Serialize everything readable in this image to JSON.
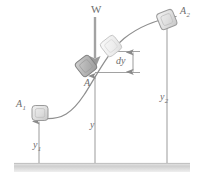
{
  "figure": {
    "type": "mechanics-free-body-diagram",
    "background_color": "#ffffff",
    "line_color": "#8a8a8a",
    "label_color": "#6d6d6d",
    "block_fill": "#d8d8d8",
    "block_fill_light": "#ececec",
    "block_stroke": "#9a9a9a",
    "ground_color": "#d0d0d0",
    "labels": {
      "weight": "W",
      "point_a": "A",
      "position_start": "A",
      "position_start_sub": "1",
      "position_end": "A",
      "position_end_sub": "2",
      "height_start": "y",
      "height_start_sub": "1",
      "height_mid": "y",
      "height_end": "y",
      "height_end_sub": "2",
      "differential": "dy"
    },
    "elements": [
      {
        "name": "curved-path",
        "kind": "curve",
        "note": "S-shaped ramp from lower-left to upper-right"
      },
      {
        "name": "ground-datum",
        "kind": "surface",
        "note": "horizontal shaded datum bar at bottom"
      },
      {
        "name": "block-a1",
        "kind": "block",
        "label": "A1",
        "state": "solid-light"
      },
      {
        "name": "block-a-current",
        "kind": "block",
        "label": "A",
        "state": "solid-dark",
        "rotated": true
      },
      {
        "name": "block-ghost",
        "kind": "block",
        "label": "",
        "state": "ghost",
        "rotated": true
      },
      {
        "name": "block-a2",
        "kind": "block",
        "label": "A2",
        "state": "solid-light",
        "rotated": true
      },
      {
        "name": "weight-arrow",
        "kind": "arrow",
        "label": "W",
        "direction": "down"
      },
      {
        "name": "dimension-y1",
        "kind": "dimension",
        "label": "y1",
        "direction": "up"
      },
      {
        "name": "dimension-y",
        "kind": "dimension",
        "label": "y",
        "direction": "up"
      },
      {
        "name": "dimension-y2",
        "kind": "dimension",
        "label": "y2",
        "direction": "up"
      },
      {
        "name": "dimension-dy",
        "kind": "dimension",
        "label": "dy",
        "direction": "double"
      }
    ]
  }
}
